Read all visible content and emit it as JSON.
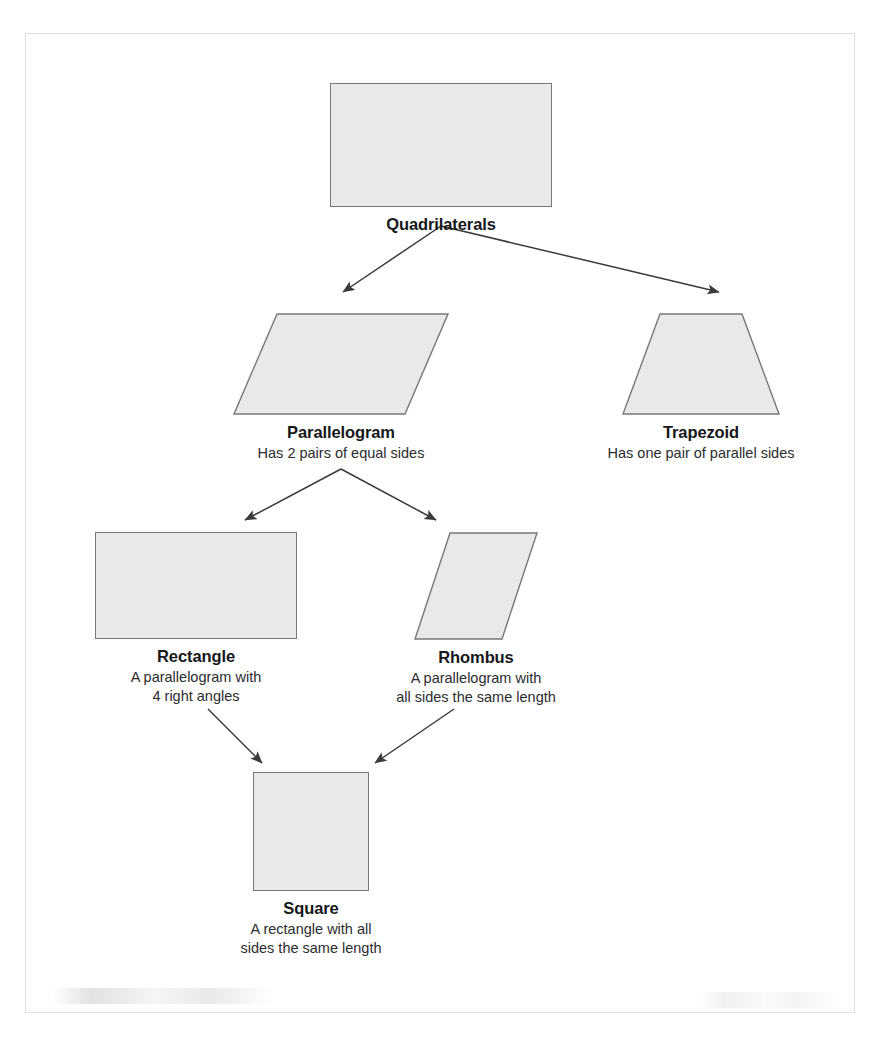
{
  "page": {
    "cut_off_header_text": "",
    "frame_border_color": "#dedede",
    "background_color": "#ffffff"
  },
  "diagram": {
    "type": "hierarchy-tree",
    "shape_fill_color": "#e9e9e9",
    "shape_stroke_color": "#787878",
    "edge_color": "#3a3a3a",
    "nodes": [
      {
        "id": "quadrilaterals",
        "title": "Quadrilaterals",
        "description": "",
        "shape": "rectangle",
        "level": 0
      },
      {
        "id": "parallelogram",
        "title": "Parallelogram",
        "description": "Has 2 pairs of equal sides",
        "shape": "parallelogram",
        "level": 1
      },
      {
        "id": "trapezoid",
        "title": "Trapezoid",
        "description": "Has one pair of parallel sides",
        "shape": "trapezoid",
        "level": 1
      },
      {
        "id": "rectangle",
        "title": "Rectangle",
        "description": "A parallelogram with\n4 right angles",
        "shape": "rectangle",
        "level": 2
      },
      {
        "id": "rhombus",
        "title": "Rhombus",
        "description": "A parallelogram with\nall sides the same length",
        "shape": "rhombus",
        "level": 2
      },
      {
        "id": "square",
        "title": "Square",
        "description": "A rectangle with all\nsides the same length",
        "shape": "square",
        "level": 3
      }
    ],
    "edges": [
      {
        "from": "quadrilaterals",
        "to": "parallelogram",
        "style": "arrow"
      },
      {
        "from": "quadrilaterals",
        "to": "trapezoid",
        "style": "arrow"
      },
      {
        "from": "parallelogram",
        "to": "rectangle",
        "style": "arrow"
      },
      {
        "from": "parallelogram",
        "to": "rhombus",
        "style": "arrow"
      },
      {
        "from": "rectangle",
        "to": "square",
        "style": "arrow"
      },
      {
        "from": "rhombus",
        "to": "square",
        "style": "arrow"
      }
    ]
  }
}
